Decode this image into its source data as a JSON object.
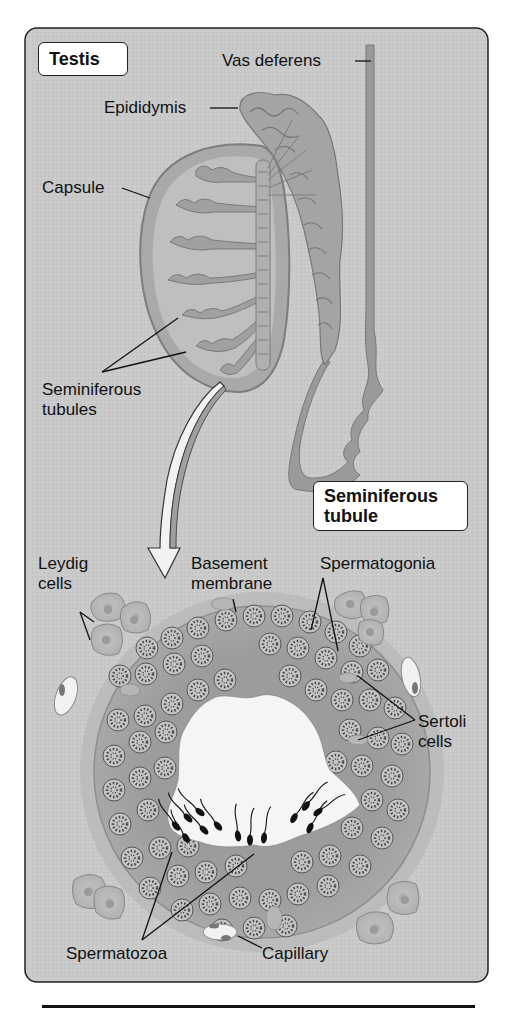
{
  "figure": {
    "panel_title_testis": "Testis",
    "panel_title_tubule_line1": "Seminiferous",
    "panel_title_tubule_line2": "tubule",
    "colors": {
      "panel_bg": "#c9c9c9",
      "tissue": "#9c9c9c",
      "tissue_dark": "#8a8a8a",
      "cell_fill": "#bdbdbd",
      "lumen": "#f4f4f4",
      "line": "#111111"
    }
  },
  "labels": {
    "vas_deferens": "Vas deferens",
    "epididymis": "Epididymis",
    "capsule": "Capsule",
    "seminiferous_tubules_line1": "Seminiferous",
    "seminiferous_tubules_line2": "tubules",
    "leydig_line1": "Leydig",
    "leydig_line2": "cells",
    "basement_line1": "Basement",
    "basement_line2": "membrane",
    "spermatogonia": "Spermatogonia",
    "sertoli_line1": "Sertoli",
    "sertoli_line2": "cells",
    "spermatozoa": "Spermatozoa",
    "capillary": "Capillary"
  }
}
